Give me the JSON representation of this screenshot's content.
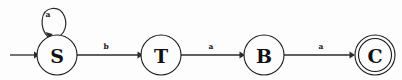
{
  "diagram": {
    "type": "finite-state-automaton",
    "canvas": {
      "width": 402,
      "height": 80,
      "background": "#fdfdfd"
    },
    "stroke_color": "#2b2b2b",
    "text_color": "#111111",
    "states": [
      {
        "id": "S",
        "label": "S",
        "cx": 57,
        "cy": 55,
        "r": 20,
        "initial": true,
        "accepting": false
      },
      {
        "id": "T",
        "label": "T",
        "cx": 161,
        "cy": 55,
        "r": 20,
        "initial": false,
        "accepting": false
      },
      {
        "id": "B",
        "label": "B",
        "cx": 264,
        "cy": 55,
        "r": 20,
        "initial": false,
        "accepting": false
      },
      {
        "id": "C",
        "label": "C",
        "cx": 375,
        "cy": 55,
        "r": 20,
        "initial": false,
        "accepting": true
      }
    ],
    "transitions": [
      {
        "from": "S",
        "to": "S",
        "symbol": "a",
        "kind": "self-loop",
        "label_x": 48,
        "label_y": 14
      },
      {
        "from": "S",
        "to": "T",
        "symbol": "b",
        "kind": "straight",
        "label_x": 106,
        "label_y": 46
      },
      {
        "from": "T",
        "to": "B",
        "symbol": "a",
        "kind": "straight",
        "label_x": 211,
        "label_y": 46
      },
      {
        "from": "B",
        "to": "C",
        "symbol": "a",
        "kind": "straight",
        "label_x": 321,
        "label_y": 46
      }
    ],
    "start_arrow": {
      "x1": 10,
      "y1": 55,
      "x2": 37,
      "y2": 55
    },
    "alphabet": [
      "a",
      "b"
    ]
  }
}
